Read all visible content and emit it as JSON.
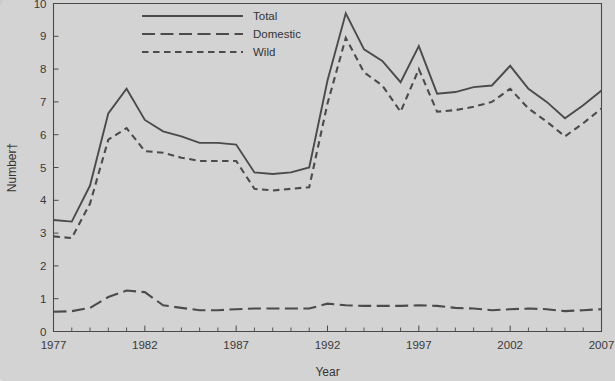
{
  "chart_data": {
    "type": "line",
    "title": "",
    "xlabel": "Year",
    "ylabel": "Number†",
    "xlim": [
      1977,
      2007
    ],
    "ylim": [
      0,
      10
    ],
    "ytick_labels": [
      "0",
      "1",
      "2",
      "3",
      "4",
      "5",
      "6",
      "7",
      "8",
      "9",
      "10"
    ],
    "xtick_labels": [
      "1977",
      "1982",
      "1987",
      "1992",
      "1997",
      "2002",
      "2007"
    ],
    "xtick_values": [
      1977,
      1982,
      1987,
      1992,
      1997,
      2002,
      2007
    ],
    "minor_xticks": "every 1 year",
    "grid": false,
    "legend_position": "top-center",
    "x": [
      1977,
      1978,
      1979,
      1980,
      1981,
      1982,
      1983,
      1984,
      1985,
      1986,
      1987,
      1988,
      1989,
      1990,
      1991,
      1992,
      1993,
      1994,
      1995,
      1996,
      1997,
      1998,
      1999,
      2000,
      2001,
      2002,
      2003,
      2004,
      2005,
      2006,
      2007
    ],
    "series": [
      {
        "name": "Total",
        "line_style": "solid",
        "values": [
          3.4,
          3.35,
          4.45,
          6.65,
          7.4,
          6.45,
          6.1,
          5.95,
          5.75,
          5.75,
          5.7,
          4.85,
          4.8,
          4.85,
          5.0,
          7.65,
          9.7,
          8.6,
          8.25,
          7.6,
          8.7,
          7.25,
          7.3,
          7.45,
          7.5,
          8.1,
          7.4,
          7.0,
          6.5,
          6.9,
          7.35
        ]
      },
      {
        "name": "Domestic",
        "line_style": "long-dash",
        "values": [
          0.6,
          0.62,
          0.72,
          1.05,
          1.25,
          1.2,
          0.8,
          0.72,
          0.65,
          0.65,
          0.68,
          0.7,
          0.7,
          0.7,
          0.7,
          0.85,
          0.8,
          0.78,
          0.78,
          0.78,
          0.8,
          0.78,
          0.72,
          0.7,
          0.65,
          0.68,
          0.7,
          0.68,
          0.62,
          0.65,
          0.68
        ]
      },
      {
        "name": "Wild",
        "line_style": "short-dash",
        "values": [
          2.9,
          2.85,
          3.9,
          5.85,
          6.2,
          5.5,
          5.45,
          5.3,
          5.2,
          5.2,
          5.2,
          4.35,
          4.3,
          4.35,
          4.4,
          6.95,
          8.95,
          7.9,
          7.5,
          6.7,
          8.0,
          6.7,
          6.75,
          6.85,
          7.0,
          7.4,
          6.8,
          6.4,
          5.95,
          6.35,
          6.8
        ]
      }
    ]
  },
  "legend": {
    "items": [
      {
        "label": "Total"
      },
      {
        "label": "Domestic"
      },
      {
        "label": "Wild"
      }
    ]
  },
  "colors": {
    "ink": "#4b4b4b",
    "paper": "#d3d3d3"
  }
}
